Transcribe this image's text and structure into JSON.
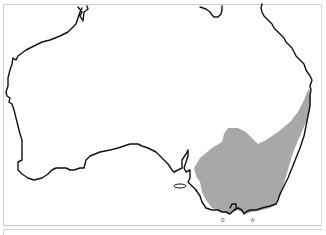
{
  "map": {
    "subject": "Australia distribution map",
    "region_shaded": "south-eastern Australia",
    "colors": {
      "background": "#ffffff",
      "coastline": "#111111",
      "distribution_fill": "#a8a8a8",
      "frame": "#cfcfcf"
    },
    "marks": {
      "left": "0",
      "right": "h"
    }
  }
}
